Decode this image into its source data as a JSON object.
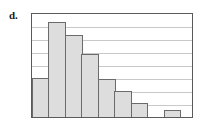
{
  "figure": {
    "part_label": "d.",
    "frame_color": "#5a5a5a",
    "grid_color": "#c9c9c9",
    "bar_fill": "#dddddd",
    "bar_stroke": "#6b6b6b",
    "background": "#ffffff"
  },
  "chart_data": {
    "type": "bar",
    "title": "",
    "subtitle": "",
    "xlabel": "",
    "ylabel": "",
    "categories": [
      "1",
      "2",
      "3",
      "4",
      "5",
      "6",
      "7",
      "8",
      "9"
    ],
    "values": [
      40,
      98,
      84,
      65,
      39,
      27,
      14,
      0,
      7
    ],
    "ylim": [
      0,
      105
    ],
    "xlim": [
      0,
      9
    ],
    "grid": true,
    "gridlines_y": [
      13,
      26,
      39,
      52,
      65,
      78,
      91,
      104
    ],
    "grid_interval": 13,
    "legend": null,
    "legend_position": "none",
    "tick_labels_x": [],
    "tick_labels_y": [],
    "annotations": []
  }
}
